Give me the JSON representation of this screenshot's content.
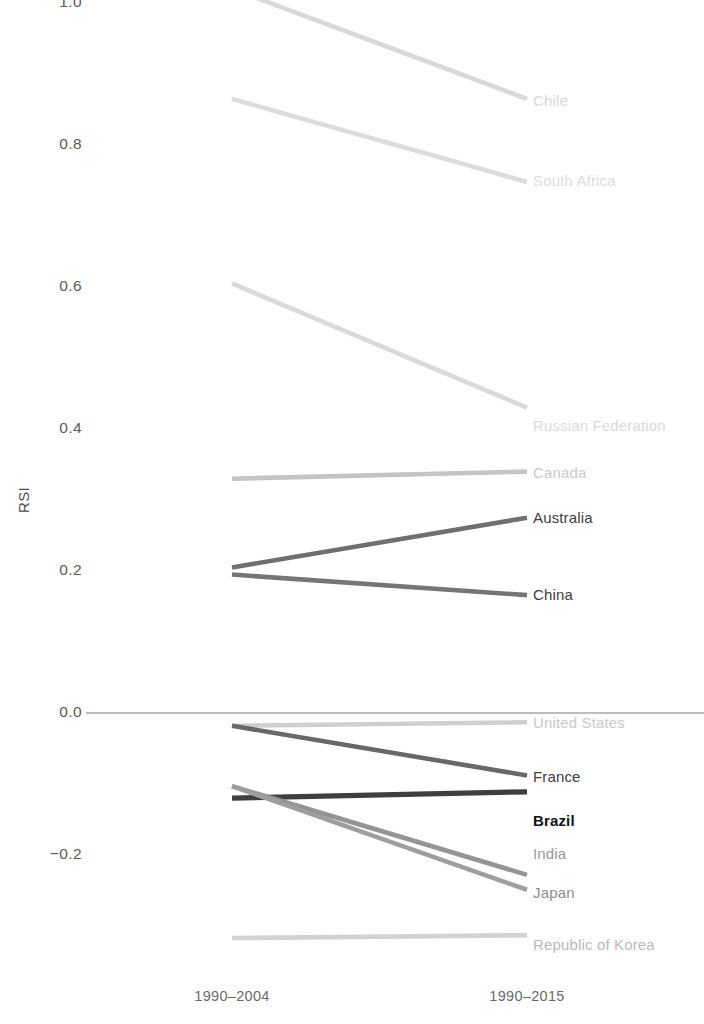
{
  "chart_data": {
    "type": "line",
    "title": "",
    "xlabel": "",
    "ylabel": "RSI",
    "categories": [
      "1990-2004",
      "1990-2015"
    ],
    "xtick_labels": [
      "1990–2004",
      "1990–2015"
    ],
    "ytick_labels": [
      "1.0",
      "0.8",
      "0.6",
      "0.4",
      "0.2",
      "0.0",
      "−0.2"
    ],
    "ytick_values": [
      1.0,
      0.8,
      0.6,
      0.4,
      0.2,
      0.0,
      -0.2
    ],
    "ylim": [
      -0.36,
      1.06
    ],
    "grid": false,
    "zero_line": true,
    "legend_position": "right-inline-labels",
    "series": [
      {
        "name": "Chile",
        "values": [
          1.02,
          0.865
        ],
        "color": "#d9d9d9",
        "label_color": "#d8d8d8",
        "bold": false
      },
      {
        "name": "South Africa",
        "values": [
          0.865,
          0.748
        ],
        "color": "#dcdcdc",
        "label_color": "#dcdcdc",
        "bold": false
      },
      {
        "name": "Russian Federation",
        "values": [
          0.605,
          0.43
        ],
        "color": "#dadada",
        "label_color": "#dadada",
        "bold": false
      },
      {
        "name": "Canada",
        "values": [
          0.33,
          0.34
        ],
        "color": "#c4c4c4",
        "label_color": "#c9c9c9",
        "bold": false
      },
      {
        "name": "Australia",
        "values": [
          0.205,
          0.275
        ],
        "color": "#6f6f6f",
        "label_color": "#3d3d3d",
        "bold": false
      },
      {
        "name": "China",
        "values": [
          0.195,
          0.166
        ],
        "color": "#757575",
        "label_color": "#3d3d3d",
        "bold": false
      },
      {
        "name": "United States",
        "values": [
          -0.018,
          -0.013
        ],
        "color": "#cfcfcf",
        "label_color": "#c9c9c9",
        "bold": false
      },
      {
        "name": "France",
        "values": [
          -0.018,
          -0.088
        ],
        "color": "#686868",
        "label_color": "#3d3d3d",
        "bold": false
      },
      {
        "name": "Brazil",
        "values": [
          -0.12,
          -0.111
        ],
        "color": "#3f3f3f",
        "label_color": "#111111",
        "bold": true
      },
      {
        "name": "India",
        "values": [
          -0.103,
          -0.228
        ],
        "color": "#949494",
        "label_color": "#9a9a9a",
        "bold": false
      },
      {
        "name": "Japan",
        "values": [
          -0.103,
          -0.249
        ],
        "color": "#9e9e9e",
        "label_color": "#8e8e8e",
        "bold": false
      },
      {
        "name": "Republic of Korea",
        "values": [
          -0.317,
          -0.313
        ],
        "color": "#d2d2d2",
        "label_color": "#b9b9b9",
        "bold": false
      }
    ],
    "zero_line_color": "#7a7a7a",
    "axis_text_color": "#5a5a5a"
  }
}
